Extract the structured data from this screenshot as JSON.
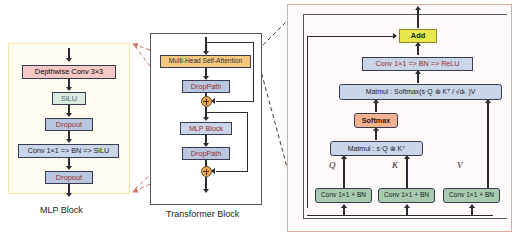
{
  "diagram": {
    "colors": {
      "mlp_frame": "#f2e6a0",
      "transformer_frame": "#55555f",
      "attention_frame": "#e8a8a0",
      "pink_box": "#f2c9c6",
      "green_box": "#dcebdf",
      "blue_box": "#b9c6e2",
      "light_blue_box": "#c9d6ea",
      "orange_box": "#f5c49a",
      "amber_box": "#f5c87e",
      "yellow_box": "#e8e84a",
      "conv_green_box": "#a9cbb0",
      "softmax_box": "#f3b392",
      "plus_node": "#f0a94e",
      "red_text": "#9b2d24",
      "dark_text": "#1a1a28",
      "line": "#2b2b33",
      "red_dashed": "#d2766a",
      "dark_dashed": "#3a3a4a"
    }
  },
  "mlp_block": {
    "caption": "MLP Block",
    "nodes": [
      {
        "id": "depthwise-conv",
        "label": "Depthwise Conv 3×3"
      },
      {
        "id": "silu",
        "label": "SiLU"
      },
      {
        "id": "dropout-1",
        "label": "Dropout"
      },
      {
        "id": "conv-bn-silu",
        "label": "Conv 1×1 => BN => SiLU"
      },
      {
        "id": "dropout-2",
        "label": "Dropout"
      }
    ]
  },
  "transformer_block": {
    "caption": "Transformer Block",
    "nodes": [
      {
        "id": "mhsa",
        "label": "Multi-Head Self-Attention"
      },
      {
        "id": "droppath-1",
        "label": "DropPath"
      },
      {
        "id": "add-1",
        "label": "⊕"
      },
      {
        "id": "mlp-block",
        "label": "MLP Block"
      },
      {
        "id": "droppath-2",
        "label": "DropPath"
      },
      {
        "id": "add-2",
        "label": "⊕"
      }
    ]
  },
  "attention_detail": {
    "add_label": "Add",
    "conv_bn_relu_label": "Conv 1×1 => BN => ReLU",
    "matmul_softmax_label": "Matmul :  Softmax(s·Q ⊗ Kᵀ / √dₖ )V",
    "softmax_label": "Softmax",
    "matmul_label": "Matmul :  s·Q ⊗ Kᵀ",
    "branch_labels": [
      "Q",
      "K",
      "V"
    ],
    "projection_label": "Conv 1×1 + BN",
    "projections": [
      {
        "id": "q-proj",
        "tag": "Q",
        "label": "Conv 1×1 + BN"
      },
      {
        "id": "k-proj",
        "tag": "K",
        "label": "Conv 1×1 + BN"
      },
      {
        "id": "v-proj",
        "tag": "V",
        "label": "Conv 1×1 + BN"
      }
    ]
  }
}
